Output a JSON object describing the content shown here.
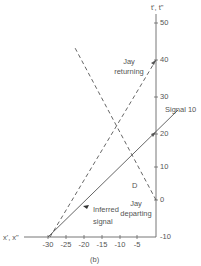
{
  "diagram": {
    "y_axis_label": "t', t\"",
    "x_axis_label": "x', x\"",
    "y_ticks": [
      "50",
      "40",
      "30",
      "20",
      "10",
      "0",
      "-10"
    ],
    "x_ticks": [
      "-30",
      "-25",
      "-20",
      "-15",
      "-10",
      "-5"
    ],
    "caption": "(b)",
    "labels": {
      "signal": "Signal 10",
      "jay_returning_1": "Jay",
      "jay_returning_2": "returning",
      "jay_departing_1": "Jay",
      "jay_departing_2": "departing",
      "inferred_1": "Inferred",
      "inferred_2": "signal",
      "point_d": "D"
    },
    "lines": [
      {
        "name": "Signal 10",
        "style": "solid",
        "from": [
          -30,
          -10
        ],
        "to": [
          6,
          26
        ]
      },
      {
        "name": "Jay returning",
        "style": "dashed",
        "from": [
          -30,
          -10
        ],
        "to": [
          0,
          40
        ]
      },
      {
        "name": "Jay departing",
        "style": "dashed",
        "from": [
          0,
          0
        ],
        "to": [
          -22,
          42
        ]
      }
    ],
    "colors": {
      "line": "#555555",
      "text": "#555555"
    }
  }
}
